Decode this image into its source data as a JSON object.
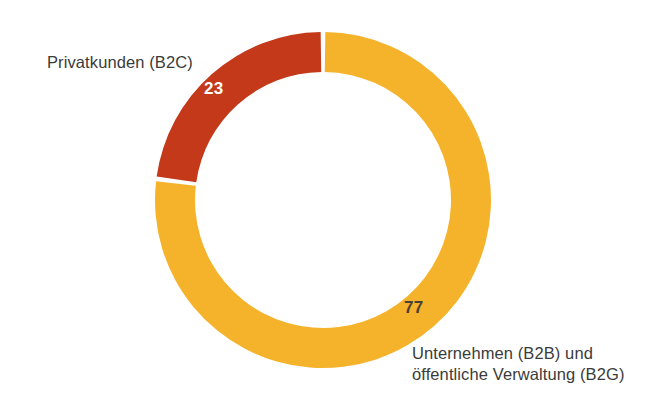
{
  "chart_data": {
    "type": "pie",
    "variant": "donut",
    "title": "",
    "subtitle": "",
    "xlabel": "",
    "ylabel": "",
    "unit": "%",
    "legend_position": "none",
    "grid": false,
    "total": 100,
    "start_angle_deg": 0,
    "direction": "clockwise",
    "categories": [
      "Unternehmen (B2B) und öffentliche Verwaltung (B2G)",
      "Privatkunden (B2C)"
    ],
    "values": [
      77,
      23
    ],
    "slices": [
      {
        "label_line1": "Unternehmen (B2B) und",
        "label_line2": "öffentliche Verwaltung (B2G)",
        "value": 77,
        "value_text": "77",
        "color": "#F5B32B",
        "value_text_color": "#4a4036"
      },
      {
        "label_line1": "Privatkunden (B2C)",
        "label_line2": "",
        "value": 23,
        "value_text": "23",
        "color": "#C4391A",
        "value_text_color": "#ffffff"
      }
    ],
    "colors": {
      "b2b_b2g": "#F5B32B",
      "b2c": "#C4391A",
      "background": "#ffffff",
      "label_text": "#3b3b3b"
    }
  },
  "geometry": {
    "center_x": 323,
    "center_y": 200,
    "outer_radius": 168,
    "inner_radius": 128,
    "gap_degrees": 1.6
  }
}
